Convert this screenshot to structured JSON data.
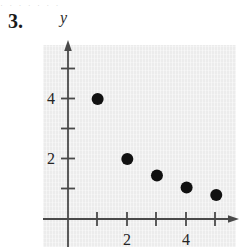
{
  "exercise": {
    "number_label": "3.",
    "bleed_text_above": "· ·   · · ·      · ·"
  },
  "chart_data": {
    "type": "scatter",
    "title": "",
    "xlabel": "",
    "ylabel": "y",
    "y_axis_label_text": "y",
    "x": [
      1,
      2,
      3,
      4,
      5
    ],
    "values": [
      4,
      2,
      1.45,
      1.05,
      0.8
    ],
    "points": [
      {
        "x": 1,
        "y": 4
      },
      {
        "x": 2,
        "y": 2
      },
      {
        "x": 3,
        "y": 1.45
      },
      {
        "x": 4,
        "y": 1.05
      },
      {
        "x": 5,
        "y": 0.8
      }
    ],
    "xlim": [
      -0.85,
      6.0
    ],
    "ylim": [
      -0.95,
      6.0
    ],
    "x_ticks": [
      1,
      2,
      3,
      4,
      5
    ],
    "x_tick_labels": [
      "",
      "2",
      "",
      "4",
      ""
    ],
    "y_ticks": [
      1,
      2,
      3,
      4,
      5
    ],
    "y_tick_labels": [
      "",
      "2",
      "",
      "4",
      ""
    ],
    "grid": false,
    "legend": false,
    "marker": "filled-circle",
    "marker_color": "#111111",
    "marker_radius_px": 6,
    "axis_color": "#4a4a4a",
    "panel_color": "#ececec",
    "arrow_heads": [
      "x-positive",
      "y-positive"
    ]
  },
  "colors": {
    "ink": "#1a1a1a",
    "axis": "#4a4a4a",
    "panel": "#ececec",
    "marker": "#111111"
  }
}
